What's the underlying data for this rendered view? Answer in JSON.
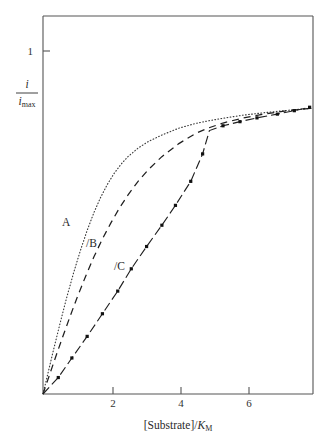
{
  "figure": {
    "background_color": "#ffffff",
    "line_color": "#1a1a1a",
    "axis_color": "#555555"
  },
  "axes": {
    "x_title_parts": {
      "bracket_open": "[",
      "substrate": "Substrate",
      "bracket_close": "]",
      "slash": "/",
      "km_symbol": "K",
      "km_subscript": "M"
    },
    "x_title": "[Substrate]/KM",
    "y_title_numerator": "i",
    "y_title_denominator": "i",
    "y_title_denominator_sub": "max",
    "y_title": "i/imax",
    "x_ticks": [
      "2",
      "4",
      "6"
    ],
    "x_tick_values": [
      2,
      4,
      6
    ],
    "y_ticks": [
      "1"
    ],
    "y_tick_values": [
      1
    ]
  },
  "chart_data": {
    "type": "line",
    "title": "",
    "subtitle": "",
    "xlabel": "[Substrate]/K_M",
    "ylabel": "i/i_max",
    "xlim": [
      0,
      7.95
    ],
    "ylim": [
      0,
      1.12
    ],
    "grid": false,
    "legend_position": "inline-annotations",
    "annotations": [
      {
        "text": "A",
        "x": 0.72,
        "y": 0.5,
        "series": "A"
      },
      {
        "text": "B",
        "x": 1.35,
        "y": 0.44,
        "series": "B"
      },
      {
        "text": "C",
        "x": 2.22,
        "y": 0.375,
        "series": "C"
      }
    ],
    "series": [
      {
        "name": "A",
        "label": "A",
        "line_style": "dotted",
        "markers": false,
        "description": "steepest rise, reaches plateau earliest",
        "x": [
          0.0,
          0.15,
          0.3,
          0.5,
          0.7,
          0.9,
          1.1,
          1.3,
          1.5,
          1.7,
          1.9,
          2.1,
          2.3,
          2.5,
          2.8,
          3.1,
          3.5,
          4.0,
          4.5,
          4.85,
          5.3,
          5.9,
          6.5,
          7.2,
          7.9
        ],
        "y": [
          0.0,
          0.062,
          0.125,
          0.205,
          0.282,
          0.353,
          0.418,
          0.477,
          0.529,
          0.574,
          0.612,
          0.644,
          0.67,
          0.692,
          0.717,
          0.736,
          0.755,
          0.775,
          0.789,
          0.796,
          0.804,
          0.813,
          0.82,
          0.827,
          0.833
        ]
      },
      {
        "name": "B",
        "label": "B",
        "line_style": "dashed",
        "markers": false,
        "description": "intermediate rise",
        "x": [
          0.0,
          0.2,
          0.4,
          0.6,
          0.8,
          1.0,
          1.25,
          1.5,
          1.75,
          2.0,
          2.25,
          2.5,
          2.8,
          3.1,
          3.5,
          4.0,
          4.5,
          4.85,
          5.3,
          5.9,
          6.5,
          7.2,
          7.9
        ],
        "y": [
          0.0,
          0.058,
          0.116,
          0.172,
          0.227,
          0.28,
          0.342,
          0.4,
          0.452,
          0.499,
          0.542,
          0.58,
          0.62,
          0.654,
          0.692,
          0.73,
          0.76,
          0.775,
          0.79,
          0.805,
          0.816,
          0.826,
          0.833
        ]
      },
      {
        "name": "C",
        "label": "C",
        "line_style": "dash-dot",
        "markers": true,
        "description": "sigmoidal, slowest rise, joins A and B near x=4.85",
        "x": [
          0.0,
          0.45,
          0.85,
          1.3,
          1.75,
          2.2,
          2.6,
          3.05,
          3.5,
          3.9,
          4.35,
          4.7,
          4.9,
          5.3,
          5.8,
          6.3,
          6.9,
          7.4,
          7.85
        ],
        "y": [
          0.0,
          0.048,
          0.105,
          0.168,
          0.234,
          0.3,
          0.365,
          0.43,
          0.492,
          0.55,
          0.62,
          0.7,
          0.768,
          0.782,
          0.794,
          0.805,
          0.816,
          0.826,
          0.836
        ],
        "marker_x": [
          0.45,
          0.85,
          1.3,
          1.75,
          2.2,
          2.6,
          3.05,
          3.5,
          3.9,
          4.35,
          4.7,
          5.3,
          5.8,
          6.3,
          6.9,
          7.4,
          7.85
        ],
        "marker_y": [
          0.048,
          0.105,
          0.168,
          0.234,
          0.3,
          0.365,
          0.43,
          0.492,
          0.55,
          0.62,
          0.7,
          0.782,
          0.794,
          0.805,
          0.816,
          0.826,
          0.836
        ]
      }
    ]
  }
}
